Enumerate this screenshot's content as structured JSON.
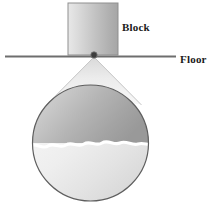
{
  "figure": {
    "background_color": "#ffffff"
  },
  "labels": {
    "block": "Block",
    "floor": "Floor"
  },
  "elements": {
    "block": {
      "name": "block",
      "shape": "square",
      "x": 68,
      "y": 3,
      "width": 50,
      "height": 51,
      "fill_light": "#e3e3e3",
      "fill_dark": "#a8a8a8",
      "stroke": "#8a8a8a"
    },
    "floor_line": {
      "name": "floor-line",
      "x1": 5,
      "y1": 57,
      "x2": 176,
      "y2": 57,
      "stroke": "#6e6e6e",
      "stroke_width": 2
    },
    "contact_point": {
      "name": "contact-point",
      "cx": 94,
      "cy": 55,
      "r": 3,
      "fill": "#3a3a3a"
    },
    "magnifier_cone": {
      "name": "magnifier-cone",
      "apex_x": 94,
      "apex_y": 57,
      "left_x": 47,
      "left_y": 103,
      "right_x": 141,
      "right_y": 103,
      "fill": "#efefef",
      "stroke": "#bcbcbc"
    },
    "magnified_circle": {
      "name": "magnified-circle",
      "cx": 90.5,
      "cy": 143,
      "r": 58,
      "stroke": "#5e5e5e",
      "upper_fill_light": "#d6d6d6",
      "upper_fill_dark": "#9a9a9a",
      "lower_fill_light": "#fbfbfb",
      "lower_fill_dark": "#d2d2d2"
    },
    "interface_wave": {
      "name": "interface-wave",
      "y": 145,
      "amplitude": 3,
      "stroke": "#ffffff",
      "stroke_width": 3
    }
  },
  "colors": {
    "ink": "#1b1b1b",
    "line": "#6e6e6e",
    "white": "#ffffff"
  }
}
